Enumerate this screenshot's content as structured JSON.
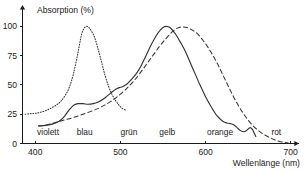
{
  "chart_data": {
    "type": "line",
    "title": "",
    "xlabel": "Wellenlänge (nm)",
    "ylabel": "Absorption (%)",
    "xlim": [
      385,
      705
    ],
    "ylim": [
      0,
      108
    ],
    "xticks": [
      400,
      500,
      600,
      700
    ],
    "xtick_labels": [
      "400",
      "500",
      "600",
      "700"
    ],
    "yticks": [
      0,
      25,
      50,
      75,
      100
    ],
    "ytick_labels": [
      "0",
      "25",
      "50",
      "75",
      "100"
    ],
    "grid": false,
    "legend": "none",
    "band_labels": [
      {
        "name": "violett",
        "x": 415
      },
      {
        "name": "blau",
        "x": 458
      },
      {
        "name": "grün",
        "x": 510
      },
      {
        "name": "gelb",
        "x": 555
      },
      {
        "name": "orange",
        "x": 617
      },
      {
        "name": "rot",
        "x": 683
      }
    ],
    "series": [
      {
        "name": "dotted-curve",
        "style": "dotted",
        "points": [
          [
            388,
            25
          ],
          [
            395,
            25.5
          ],
          [
            402,
            26
          ],
          [
            410,
            27.5
          ],
          [
            418,
            30
          ],
          [
            425,
            33
          ],
          [
            430,
            36
          ],
          [
            435,
            41
          ],
          [
            440,
            48
          ],
          [
            445,
            60
          ],
          [
            450,
            77
          ],
          [
            454,
            92
          ],
          [
            457,
            98
          ],
          [
            460,
            100
          ],
          [
            463,
            99
          ],
          [
            466,
            96
          ],
          [
            470,
            90
          ],
          [
            474,
            80
          ],
          [
            478,
            69
          ],
          [
            482,
            58
          ],
          [
            486,
            49
          ],
          [
            490,
            42
          ],
          [
            494,
            37
          ],
          [
            498,
            33
          ],
          [
            502,
            30
          ],
          [
            506,
            28.5
          ]
        ]
      },
      {
        "name": "solid-curve",
        "style": "solid",
        "points": [
          [
            404,
            15
          ],
          [
            412,
            15.5
          ],
          [
            420,
            16.5
          ],
          [
            428,
            19
          ],
          [
            434,
            23
          ],
          [
            438,
            27
          ],
          [
            442,
            30.5
          ],
          [
            446,
            33
          ],
          [
            450,
            34
          ],
          [
            456,
            34
          ],
          [
            462,
            33.5
          ],
          [
            468,
            34
          ],
          [
            474,
            35.5
          ],
          [
            480,
            38
          ],
          [
            486,
            41.5
          ],
          [
            492,
            45
          ],
          [
            496,
            47
          ],
          [
            500,
            48
          ],
          [
            504,
            49
          ],
          [
            508,
            51
          ],
          [
            512,
            54
          ],
          [
            518,
            59
          ],
          [
            524,
            66
          ],
          [
            530,
            75
          ],
          [
            536,
            84
          ],
          [
            542,
            92
          ],
          [
            547,
            97
          ],
          [
            551,
            99.5
          ],
          [
            554,
            100
          ],
          [
            558,
            99
          ],
          [
            562,
            96
          ],
          [
            566,
            92
          ],
          [
            570,
            87
          ],
          [
            576,
            79
          ],
          [
            582,
            69
          ],
          [
            588,
            59
          ],
          [
            594,
            49
          ],
          [
            600,
            40
          ],
          [
            606,
            32
          ],
          [
            612,
            25
          ],
          [
            617,
            21
          ],
          [
            621,
            18.5
          ],
          [
            625,
            17.5
          ],
          [
            629,
            17
          ],
          [
            633,
            16
          ],
          [
            637,
            13.5
          ],
          [
            641,
            11
          ],
          [
            645,
            10
          ],
          [
            648,
            11
          ],
          [
            651,
            13
          ],
          [
            653,
            13.5
          ],
          [
            655,
            12
          ],
          [
            657,
            9
          ],
          [
            659,
            6
          ]
        ]
      },
      {
        "name": "dashed-curve",
        "style": "dashed",
        "points": [
          [
            404,
            15
          ],
          [
            414,
            16
          ],
          [
            424,
            18
          ],
          [
            434,
            20
          ],
          [
            444,
            22
          ],
          [
            454,
            24.5
          ],
          [
            464,
            27
          ],
          [
            474,
            30
          ],
          [
            482,
            33
          ],
          [
            490,
            36.5
          ],
          [
            498,
            41
          ],
          [
            506,
            46
          ],
          [
            514,
            52
          ],
          [
            522,
            59
          ],
          [
            530,
            67
          ],
          [
            538,
            75
          ],
          [
            546,
            83
          ],
          [
            554,
            90
          ],
          [
            561,
            95.5
          ],
          [
            567,
            98.5
          ],
          [
            572,
            99.5
          ],
          [
            578,
            99
          ],
          [
            584,
            97
          ],
          [
            590,
            94
          ],
          [
            596,
            89
          ],
          [
            602,
            83
          ],
          [
            608,
            76
          ],
          [
            614,
            68
          ],
          [
            620,
            59
          ],
          [
            626,
            50
          ],
          [
            632,
            41
          ],
          [
            638,
            33
          ],
          [
            644,
            26
          ],
          [
            650,
            20
          ],
          [
            656,
            15
          ],
          [
            662,
            11
          ],
          [
            668,
            8
          ],
          [
            674,
            5.5
          ],
          [
            680,
            3.5
          ],
          [
            686,
            2
          ],
          [
            692,
            1
          ],
          [
            697,
            0.5
          ]
        ]
      }
    ]
  }
}
